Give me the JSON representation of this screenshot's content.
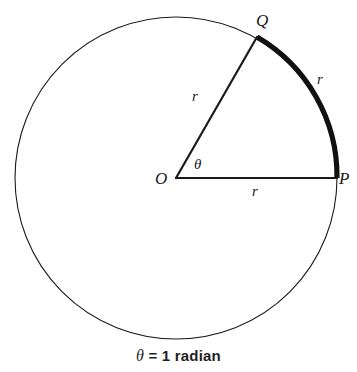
{
  "figure": {
    "name": "radian-definition-diagram",
    "caption_theta": "θ",
    "caption_rest": " = 1 radian",
    "caption_full": "θ = 1 radian",
    "stroke_color": "#1a1a1a",
    "arc_color": "#111111",
    "background_color": "#ffffff"
  },
  "geometry": {
    "center": {
      "x": 176,
      "y": 178
    },
    "radius": 161,
    "circle_stroke_width": 1.1,
    "radii_stroke_width": 2.2,
    "arc_stroke_width": 5.2,
    "angle_degrees": 57.3,
    "angle_radians": 1,
    "point_P": {
      "x": 337,
      "y": 178,
      "angle_deg": 0
    },
    "point_Q": {
      "x": 257,
      "y": 37,
      "angle_deg": 299.4
    }
  },
  "labels": {
    "center_point": {
      "text": "O",
      "x": 155,
      "y": 170
    },
    "point_q": {
      "text": "Q",
      "x": 256,
      "y": 12
    },
    "point_p": {
      "text": "P",
      "x": 339,
      "y": 170
    },
    "radius_oq": {
      "text": "r",
      "x": 192,
      "y": 89
    },
    "radius_op": {
      "text": "r",
      "x": 252,
      "y": 184
    },
    "arc_qp": {
      "text": "r",
      "x": 317,
      "y": 72
    },
    "angle_theta": {
      "text": "θ",
      "x": 194,
      "y": 157
    }
  }
}
